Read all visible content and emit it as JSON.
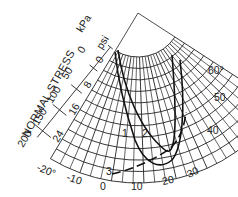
{
  "diagram": {
    "axis_title": "NORMAL STRESS",
    "unit_kpa": "kPa",
    "unit_psi": "psi",
    "kpa_ticks": [
      "0",
      "50",
      "100",
      "150",
      "200"
    ],
    "psi_ticks": [
      "0",
      "8",
      "16",
      "24"
    ],
    "angle_ticks": [
      "-20°",
      "-10",
      "0",
      "10",
      "20",
      "30",
      "40",
      "50",
      "60°"
    ],
    "curve_labels": [
      "1",
      "2",
      "3"
    ]
  },
  "chart_data": {
    "type": "polar-envelope",
    "title": "",
    "radial_axis": {
      "label": "NORMAL STRESS",
      "units": [
        "kPa",
        "psi"
      ],
      "kpa_range": [
        0,
        200
      ],
      "psi_range": [
        0,
        24
      ]
    },
    "angular_axis": {
      "range_deg": [
        -20,
        60
      ],
      "ticks": [
        -20,
        -10,
        0,
        10,
        20,
        30,
        40,
        50,
        60
      ]
    },
    "series": [
      {
        "name": "1"
      },
      {
        "name": "2"
      },
      {
        "name": "3"
      }
    ]
  }
}
